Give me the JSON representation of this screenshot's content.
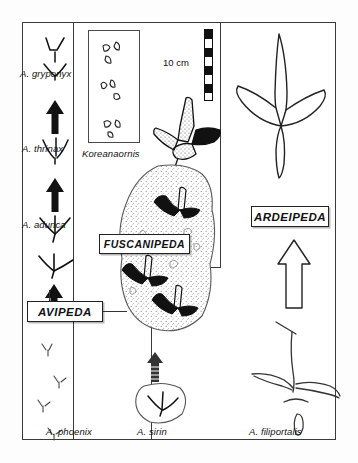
{
  "figure": {
    "scale": {
      "label": "10 cm",
      "segments": 8
    },
    "colors": {
      "ink": "#111111",
      "frame": "#3a3a3a",
      "stipple": "#8a8a8a",
      "fill": "#000000"
    }
  },
  "panels": {
    "left": {
      "name": "avipeda-column"
    },
    "middle": {
      "name": "koreanaornis-column"
    },
    "right": {
      "name": "ardeipeda-column"
    }
  },
  "genera": [
    {
      "id": "avipeda",
      "label": "AVIPEDA"
    },
    {
      "id": "fuscanipeda",
      "label": "FUSCANIPEDA"
    },
    {
      "id": "ardeipeda",
      "label": "ARDEIPEDA"
    }
  ],
  "species": [
    {
      "id": "gryponyx",
      "label": "A. gryponyx"
    },
    {
      "id": "thrinax",
      "label": "A. thrinax"
    },
    {
      "id": "adunca",
      "label": "A. adunca"
    },
    {
      "id": "phoenix",
      "label": "A. phoenix"
    },
    {
      "id": "sirin",
      "label": "A. sirin"
    },
    {
      "id": "filiportalis",
      "label": "A. filiportalis"
    }
  ],
  "inset": {
    "label": "Koreanaornis"
  }
}
